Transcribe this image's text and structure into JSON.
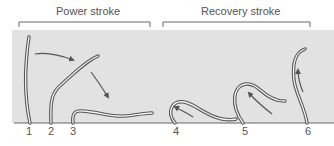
{
  "diagram": {
    "phases": [
      {
        "label": "Power stroke",
        "stages": [
          1,
          2,
          3
        ]
      },
      {
        "label": "Recovery stroke",
        "stages": [
          4,
          5,
          6
        ]
      }
    ],
    "stage_labels": [
      "1",
      "2",
      "3",
      "4",
      "5",
      "6"
    ],
    "colors": {
      "panel": "#e2e2e2",
      "cilium_outline": "#555555",
      "cilium_fill": "#f4f4f4",
      "arrow": "#555555",
      "bracket": "#666666",
      "text": "#555555"
    }
  }
}
